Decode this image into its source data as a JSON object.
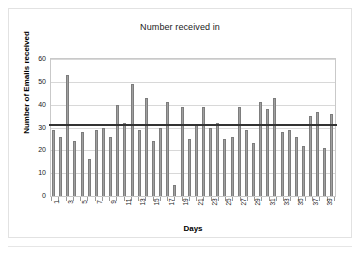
{
  "chart_data": {
    "type": "bar",
    "title": "Number received in",
    "xlabel": "Days",
    "ylabel": "Number of Emails received",
    "categories": [
      1,
      2,
      3,
      4,
      5,
      6,
      7,
      8,
      9,
      10,
      11,
      12,
      13,
      14,
      15,
      16,
      17,
      18,
      19,
      20,
      21,
      22,
      23,
      24,
      25,
      26,
      27,
      28,
      29,
      30,
      31,
      32,
      33,
      34,
      35,
      36,
      37,
      38,
      39,
      40
    ],
    "values": [
      29,
      26,
      53,
      24,
      28,
      16,
      29,
      30,
      26,
      40,
      32,
      49,
      29,
      43,
      24,
      30,
      41,
      5,
      39,
      25,
      31,
      39,
      30,
      32,
      25,
      26,
      39,
      29,
      23,
      41,
      38,
      43,
      28,
      29,
      26,
      22,
      35,
      37,
      21,
      36
    ],
    "ylim": [
      0,
      60
    ],
    "yticks": [
      0,
      10,
      20,
      30,
      40,
      50,
      60
    ],
    "xtick_labels": [
      "1",
      "3",
      "5",
      "7",
      "9",
      "11",
      "13",
      "15",
      "17",
      "19",
      "21",
      "23",
      "25",
      "27",
      "29",
      "31",
      "33",
      "35",
      "37",
      "39"
    ],
    "xtick_label_rotation": -90,
    "grid": true,
    "legend": "none",
    "bar_color": "#a0a0a0",
    "bar_edge_color": "#7d7d7d",
    "reference_line": {
      "name": "mean-line",
      "value": 31.4,
      "color": "#333333"
    }
  }
}
